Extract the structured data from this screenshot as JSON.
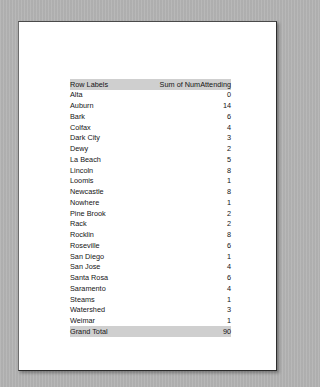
{
  "document": {
    "type": "scanned-page",
    "background_color": "#b4b4b4",
    "page_color": "#ffffff"
  },
  "table": {
    "name": "pivot-table",
    "header_background": "#cfcfcf",
    "columns": [
      {
        "key": "label",
        "header": "Row Labels",
        "align": "left"
      },
      {
        "key": "value",
        "header": "Sum of NumAttending",
        "align": "right"
      }
    ],
    "rows": [
      {
        "label": "Alta",
        "value": "0"
      },
      {
        "label": "Auburn",
        "value": "14"
      },
      {
        "label": "Bark",
        "value": "6"
      },
      {
        "label": "Colfax",
        "value": "4"
      },
      {
        "label": "Dark City",
        "value": "3"
      },
      {
        "label": "Dewy",
        "value": "2"
      },
      {
        "label": "La Beach",
        "value": "5"
      },
      {
        "label": "Lincoln",
        "value": "8"
      },
      {
        "label": "Loomis",
        "value": "1"
      },
      {
        "label": "Newcastle",
        "value": "8"
      },
      {
        "label": "Nowhere",
        "value": "1"
      },
      {
        "label": "Pine Brook",
        "value": "2"
      },
      {
        "label": "Rack",
        "value": "2"
      },
      {
        "label": "Rocklin",
        "value": "8"
      },
      {
        "label": "Roseville",
        "value": "6"
      },
      {
        "label": "San Diego",
        "value": "1"
      },
      {
        "label": "San Jose",
        "value": "4"
      },
      {
        "label": "Santa Rosa",
        "value": "6"
      },
      {
        "label": "Saramento",
        "value": "4"
      },
      {
        "label": "Steams",
        "value": "1"
      },
      {
        "label": "Watershed",
        "value": "3"
      },
      {
        "label": "Weimar",
        "value": "1"
      }
    ],
    "total_row": {
      "label": "Grand Total",
      "value": "90"
    }
  }
}
